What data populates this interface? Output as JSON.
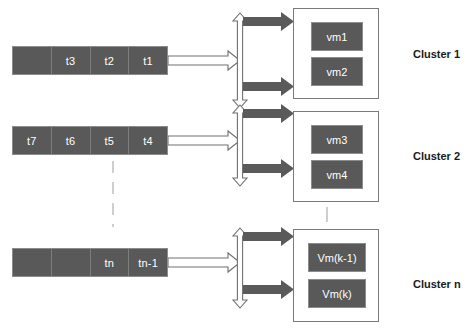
{
  "diagram": {
    "colors": {
      "box_fill": "#595959",
      "box_border": "#8c8c8c",
      "cluster_border": "#7a7a7a",
      "hollow_arrow_fill": "#ffffff",
      "hollow_arrow_stroke": "#666666",
      "solid_arrow_fill": "#5a5a5a",
      "text_on_dark": "#ffffff",
      "label_text": "#1a1a1a",
      "dash_color": "#b0b0b0",
      "background": "#ffffff"
    },
    "task_queues": [
      {
        "name": "queue-1",
        "cells": [
          "",
          "t3",
          "t2",
          "t1"
        ]
      },
      {
        "name": "queue-2",
        "cells": [
          "t7",
          "t6",
          "t5",
          "t4"
        ]
      },
      {
        "name": "queue-n",
        "cells": [
          "",
          "",
          "tn",
          "tn-1"
        ]
      }
    ],
    "clusters": [
      {
        "label": "Cluster 1",
        "vms": [
          "vm1",
          "vm2"
        ]
      },
      {
        "label": "Cluster 2",
        "vms": [
          "vm3",
          "vm4"
        ]
      },
      {
        "label": "Cluster n",
        "vms": [
          "Vm(k-1)",
          "Vm(k)"
        ]
      }
    ],
    "connectors": {
      "queue_to_splitter": "hollow-right-arrow",
      "splitter": "hollow-vertical-double-arrow",
      "splitter_to_cluster": "solid-right-arrow",
      "queue_ellipsis": "vertical-dashed-line",
      "cluster_ellipsis": "vertical-dashed-line"
    }
  }
}
